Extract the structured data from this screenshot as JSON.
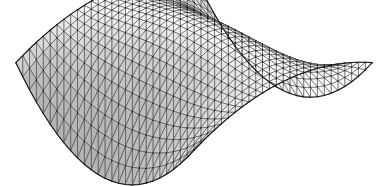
{
  "figure": {
    "title": "",
    "background_color": "#ffffff",
    "width": 387,
    "height": 187,
    "caption": ""
  },
  "style": {
    "edge_color": "#3a3a3a",
    "edge_width": 0.55,
    "silhouette_color": "#1c1c1c",
    "silhouette_width": 1.15,
    "vertex_color": "#1a1a1a",
    "vertex_radius": 0.62,
    "face_light_color": "#ffffff",
    "face_dark_color": "#9a9a9a",
    "face_base_color": "#d6d6d6"
  },
  "chart_data": {
    "type": "surface",
    "title": "",
    "subtitle": "",
    "xlabel": "",
    "ylabel": "",
    "zlabel": "",
    "grid": false,
    "legend": "none",
    "axes_visible": false,
    "surface_kind": "saddle-pillow",
    "mesh": {
      "rendering": "wireframe-with-shaded-triangular-facets",
      "triangulation": "quad-split-diagonal",
      "u_divisions": 26,
      "v_divisions": 26,
      "u_range": [
        -1,
        1
      ],
      "v_range": [
        -1,
        1
      ],
      "z_formula_terms": [
        {
          "name": "dome",
          "coefficient": 0.78,
          "expression": "cos(pi*u/2)*cos(pi*v/2)"
        },
        {
          "name": "saddle",
          "coefficient": 0.62,
          "expression": "u*u - v*v"
        },
        {
          "name": "corner_lift",
          "coefficient": 0.3,
          "expression": "u*u*v*v"
        }
      ],
      "zlim": [
        -1.05,
        0.95
      ]
    },
    "projection": {
      "type": "axonometric",
      "azimuth_deg": 45,
      "elevation_deg": 22,
      "scale_x": 126,
      "scale_y": 62,
      "scale_z": 78,
      "origin_x": 194,
      "origin_y": 86
    },
    "landmarks": [
      {
        "name": "left-tip",
        "x": 22,
        "y": 52,
        "note": "raised left corner"
      },
      {
        "name": "right-tip",
        "x": 368,
        "y": 55,
        "note": "raised right corner"
      },
      {
        "name": "back-ridge-top",
        "x": 196,
        "y": 10,
        "note": "domed back corner"
      },
      {
        "name": "front-vertex",
        "x": 200,
        "y": 176,
        "note": "lowest front corner point"
      }
    ]
  }
}
